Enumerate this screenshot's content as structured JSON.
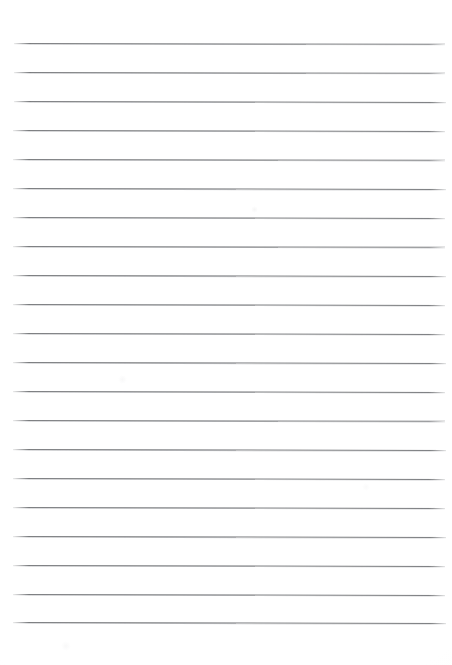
{
  "document": {
    "kind": "scanned-lined-paper",
    "title": "Blank lined notebook page",
    "page_width": 452,
    "page_height": 665,
    "background_color": "#ffffff",
    "rule_color": "#6f7174",
    "rule_thickness_px": 1,
    "rule_left_x": 13,
    "rule_right_x": 445,
    "first_rule_y": 43,
    "last_rule_y": 622,
    "rule_spacing_px": 29,
    "rule_count": 21,
    "top_margin_px": 43,
    "bottom_margin_px": 43,
    "scan_tilt_deg": 0.12,
    "written_text": "",
    "notes": "No handwriting, no printed text, no header or margin rule present."
  },
  "rules": [
    {
      "index": 1,
      "y": 43,
      "x1": 14,
      "x2": 445,
      "tilt": 0.1
    },
    {
      "index": 2,
      "y": 72,
      "x1": 14,
      "x2": 445,
      "tilt": 0.1
    },
    {
      "index": 3,
      "y": 101,
      "x1": 14,
      "x2": 446,
      "tilt": 0.12
    },
    {
      "index": 4,
      "y": 130,
      "x1": 13,
      "x2": 445,
      "tilt": 0.12
    },
    {
      "index": 5,
      "y": 159,
      "x1": 13,
      "x2": 445,
      "tilt": 0.11
    },
    {
      "index": 6,
      "y": 188,
      "x1": 13,
      "x2": 446,
      "tilt": 0.13
    },
    {
      "index": 7,
      "y": 217,
      "x1": 13,
      "x2": 445,
      "tilt": 0.12
    },
    {
      "index": 8,
      "y": 246,
      "x1": 13,
      "x2": 445,
      "tilt": 0.11
    },
    {
      "index": 9,
      "y": 275,
      "x1": 13,
      "x2": 446,
      "tilt": 0.13
    },
    {
      "index": 10,
      "y": 304,
      "x1": 13,
      "x2": 445,
      "tilt": 0.12
    },
    {
      "index": 11,
      "y": 333,
      "x1": 13,
      "x2": 445,
      "tilt": 0.12
    },
    {
      "index": 12,
      "y": 362,
      "x1": 13,
      "x2": 446,
      "tilt": 0.13
    },
    {
      "index": 13,
      "y": 391,
      "x1": 13,
      "x2": 445,
      "tilt": 0.12
    },
    {
      "index": 14,
      "y": 420,
      "x1": 13,
      "x2": 445,
      "tilt": 0.11
    },
    {
      "index": 15,
      "y": 449,
      "x1": 13,
      "x2": 446,
      "tilt": 0.13
    },
    {
      "index": 16,
      "y": 478,
      "x1": 13,
      "x2": 445,
      "tilt": 0.12
    },
    {
      "index": 17,
      "y": 507,
      "x1": 13,
      "x2": 445,
      "tilt": 0.12
    },
    {
      "index": 18,
      "y": 536,
      "x1": 13,
      "x2": 446,
      "tilt": 0.13
    },
    {
      "index": 19,
      "y": 565,
      "x1": 13,
      "x2": 445,
      "tilt": 0.12
    },
    {
      "index": 20,
      "y": 594,
      "x1": 13,
      "x2": 445,
      "tilt": 0.12
    },
    {
      "index": 21,
      "y": 622,
      "x1": 13,
      "x2": 446,
      "tilt": 0.13
    }
  ],
  "marks": [
    {
      "name": "paper-smudge-upper",
      "x": 254,
      "y": 209,
      "size": 7,
      "opacity": 0.07
    },
    {
      "name": "paper-smudge-mid",
      "x": 122,
      "y": 379,
      "size": 9,
      "opacity": 0.05
    },
    {
      "name": "paper-smudge-lower",
      "x": 66,
      "y": 646,
      "size": 10,
      "opacity": 0.05
    },
    {
      "name": "paper-smudge-right",
      "x": 366,
      "y": 487,
      "size": 8,
      "opacity": 0.04
    }
  ]
}
